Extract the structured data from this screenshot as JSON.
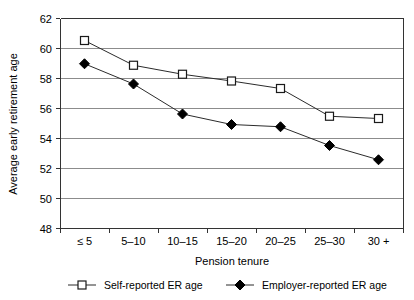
{
  "chart_data": {
    "type": "line",
    "title": "",
    "subtitle": "",
    "xlabel": "Pension tenure",
    "ylabel": "Average early retirement age",
    "categories": [
      "≤ 5",
      "5–10",
      "10–15",
      "15–20",
      "20–25",
      "25–30",
      "30 +"
    ],
    "ylim": [
      48,
      62
    ],
    "ytick_labels": [
      "48",
      "50",
      "52",
      "54",
      "56",
      "58",
      "60",
      "62"
    ],
    "yticks": [
      48,
      50,
      52,
      54,
      56,
      58,
      60,
      62
    ],
    "grid": true,
    "legend_position": "bottom",
    "series": [
      {
        "name": "Self-reported ER age",
        "marker": "open-square",
        "color": "#000000",
        "values": [
          60.5,
          58.85,
          58.25,
          57.8,
          57.3,
          55.45,
          55.3
        ]
      },
      {
        "name": "Employer-reported ER age",
        "marker": "filled-diamond",
        "color": "#000000",
        "values": [
          58.95,
          57.6,
          55.6,
          54.9,
          54.75,
          53.5,
          52.55
        ]
      }
    ]
  },
  "legend": {
    "items": [
      {
        "label": "Self-reported ER age",
        "marker": "open-square"
      },
      {
        "label": "Employer-reported ER age",
        "marker": "filled-diamond"
      }
    ]
  },
  "axes": {
    "y_title": "Average early retirement age",
    "x_title": "Pension tenure"
  }
}
